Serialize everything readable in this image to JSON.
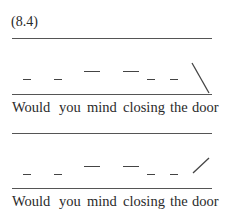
{
  "example_label": "(8.4)",
  "examples": [
    {
      "words": [
        "Would",
        "you",
        "mind",
        "closing",
        "the",
        "door"
      ],
      "contour": "falling",
      "pitch_marks": [
        "low",
        "low",
        "high",
        "high",
        "low",
        "low",
        "fall"
      ]
    },
    {
      "words": [
        "Would",
        "you",
        "mind",
        "closing",
        "the",
        "door"
      ],
      "contour": "rising",
      "pitch_marks": [
        "low",
        "low",
        "high",
        "high",
        "low",
        "low",
        "rise"
      ]
    }
  ]
}
